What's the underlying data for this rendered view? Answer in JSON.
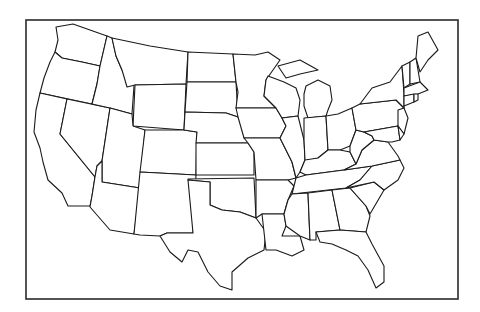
{
  "map": {
    "title": "",
    "type": "outline-map",
    "region": "Contiguous United States",
    "colors": {
      "background": "#ffffff",
      "stroke": "#1a1a1a",
      "fill": "#ffffff"
    },
    "frame": {
      "x": 26,
      "y": 20,
      "width": 432,
      "height": 279
    },
    "states": [
      {
        "id": "WA",
        "d": "M56,27 L73,24 L107,36 L100,66 L82,62 L62,58 L55,52 L58,40 Z"
      },
      {
        "id": "OR",
        "d": "M55,52 L62,58 L82,62 L100,66 L97,84 L92,104 L40,93 L44,78 L50,62 Z"
      },
      {
        "id": "CA",
        "d": "M40,93 L67,99 L60,134 L95,177 L92,196 L90,206 L68,206 L62,193 L48,180 L43,162 L40,148 L34,132 L36,110 Z"
      },
      {
        "id": "NV",
        "d": "M67,99 L110,108 L102,161 L97,166 L95,177 L60,134 Z"
      },
      {
        "id": "ID",
        "d": "M107,36 L112,38 L116,56 L122,70 L134,86 L132,114 L110,108 L92,104 L97,84 L100,66 Z"
      },
      {
        "id": "MT",
        "d": "M112,38 L150,46 L188,52 L186,84 L135,85 L127,87 L122,70 L116,56 Z"
      },
      {
        "id": "WY",
        "d": "M135,85 L186,84 L184,130 L133,126 Z"
      },
      {
        "id": "UT",
        "d": "M110,108 L132,114 L133,126 L145,130 L140,188 L102,182 L102,161 Z"
      },
      {
        "id": "AZ",
        "d": "M102,161 L102,182 L140,188 L134,234 L110,230 L90,207 L92,196 L95,177 L97,166 Z"
      },
      {
        "id": "CO",
        "d": "M145,130 L184,130 L197,132 L196,175 L140,172 Z"
      },
      {
        "id": "NM",
        "d": "M140,172 L196,175 L193,233 L167,233 L160,236 L140,235 L134,234 Z"
      },
      {
        "id": "ND",
        "d": "M188,52 L233,54 L236,82 L187,82 Z"
      },
      {
        "id": "SD",
        "d": "M187,82 L236,82 L238,117 L226,113 L185,112 Z"
      },
      {
        "id": "NE",
        "d": "M185,112 L226,113 L238,117 L244,128 L248,143 L196,143 L197,132 L184,130 Z"
      },
      {
        "id": "KS",
        "d": "M196,143 L248,143 L254,152 L254,175 L196,175 Z"
      },
      {
        "id": "OK",
        "d": "M188,179 L254,178 L256,218 L240,212 L222,210 L210,205 L210,182 L188,180 Z"
      },
      {
        "id": "TX",
        "d": "M188,180 L210,182 L210,205 L222,210 L240,212 L256,218 L266,232 L264,250 L248,258 L232,272 L232,290 L220,286 L208,272 L198,252 L188,250 L182,262 L170,252 L160,236 L167,233 L193,233 Z"
      },
      {
        "id": "MN",
        "d": "M233,54 L255,55 L268,52 L280,60 L266,80 L264,96 L276,108 L236,108 L238,92 L236,82 Z"
      },
      {
        "id": "IA",
        "d": "M236,108 L276,108 L282,118 L286,126 L280,138 L244,138 L238,117 Z"
      },
      {
        "id": "MO",
        "d": "M244,138 L280,138 L286,150 L292,162 L296,178 L288,180 L256,180 L254,152 L248,143 Z"
      },
      {
        "id": "AR",
        "d": "M256,180 L288,180 L294,186 L288,200 L284,214 L262,214 L256,218 Z"
      },
      {
        "id": "LA",
        "d": "M262,214 L284,214 L286,226 L282,236 L300,236 L304,250 L292,256 L276,250 L266,250 L264,232 Z"
      },
      {
        "id": "WI",
        "d": "M268,76 L284,82 L296,88 L300,100 L298,116 L282,118 L276,108 L264,96 L266,80 Z"
      },
      {
        "id": "IL",
        "d": "M282,118 L298,116 L304,140 L305,160 L300,172 L296,178 L292,162 L286,150 L280,138 L286,126 Z"
      },
      {
        "id": "MI",
        "d": "M306,86 L318,80 L330,86 L332,100 L328,110 L326,116 L308,118 L304,106 L304,94 Z M278,66 L300,60 L318,70 L300,74 L286,78 Z"
      },
      {
        "id": "IN",
        "d": "M304,118 L326,116 L328,150 L318,158 L306,162 L305,160 L304,140 Z"
      },
      {
        "id": "OH",
        "d": "M326,116 L338,114 L352,108 L356,130 L350,146 L340,150 L328,150 Z"
      },
      {
        "id": "KY",
        "d": "M300,172 L305,160 L318,158 L328,150 L340,150 L350,152 L356,164 L344,170 L306,175 Z"
      },
      {
        "id": "TN",
        "d": "M296,178 L306,175 L344,170 L372,166 L360,180 L346,188 L292,194 L294,186 Z"
      },
      {
        "id": "MS",
        "d": "M292,194 L308,193 L310,240 L300,236 L286,226 L284,214 L288,200 Z"
      },
      {
        "id": "AL",
        "d": "M308,193 L332,190 L340,230 L316,232 L316,240 L310,240 Z"
      },
      {
        "id": "GA",
        "d": "M332,190 L350,188 L366,206 L370,216 L366,232 L340,230 Z"
      },
      {
        "id": "FL",
        "d": "M316,232 L340,230 L366,232 L372,244 L384,266 L384,282 L376,288 L368,270 L358,256 L346,250 L332,244 L320,242 Z"
      },
      {
        "id": "SC",
        "d": "M350,188 L374,182 L384,190 L370,214 L366,206 Z"
      },
      {
        "id": "NC",
        "d": "M346,188 L360,180 L372,166 L400,160 L404,168 L398,180 L384,190 L374,182 Z"
      },
      {
        "id": "VA",
        "d": "M344,170 L356,164 L362,150 L374,140 L388,142 L398,156 L400,160 L372,166 Z"
      },
      {
        "id": "WV",
        "d": "M350,146 L356,130 L364,132 L372,136 L374,140 L362,150 L356,164 L350,152 Z"
      },
      {
        "id": "PA",
        "d": "M352,108 L360,104 L396,100 L404,108 L398,126 L364,132 L356,130 Z"
      },
      {
        "id": "NY",
        "d": "M360,104 L372,88 L390,82 L402,66 L404,94 L404,108 L396,100 Z"
      },
      {
        "id": "MD",
        "d": "M364,132 L398,126 L400,140 L392,142 L388,142 L374,140 L372,136 Z"
      },
      {
        "id": "NJ",
        "d": "M398,110 L404,108 L408,118 L404,134 L398,126 Z"
      },
      {
        "id": "DE",
        "d": "M398,126 L404,134 L400,140 Z"
      },
      {
        "id": "VT",
        "d": "M402,66 L410,62 L410,84 L404,88 Z"
      },
      {
        "id": "NH",
        "d": "M410,62 L416,58 L420,82 L410,84 Z"
      },
      {
        "id": "ME",
        "d": "M416,58 L418,36 L428,32 L438,50 L428,60 L420,72 Z"
      },
      {
        "id": "MA",
        "d": "M404,88 L420,82 L428,90 L418,94 L404,96 Z"
      },
      {
        "id": "CT",
        "d": "M404,96 L414,94 L414,102 L404,106 Z"
      },
      {
        "id": "RI",
        "d": "M414,94 L418,94 L418,100 L414,102 Z"
      }
    ]
  }
}
